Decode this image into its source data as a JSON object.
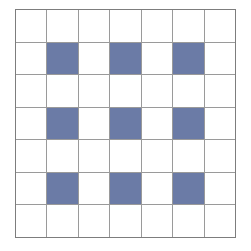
{
  "figure": {
    "name": "checkerboard-grid",
    "rows": 7,
    "columns": 7,
    "fill_color": "#6b7ba6",
    "empty_color": "#ffffff",
    "gridline_color": "#9a9a9a",
    "border_color": "#7d7d7d",
    "background_color": "#ffffff"
  },
  "chart_data": {
    "type": "heatmap",
    "title": "",
    "xlabel": "",
    "ylabel": "",
    "rows": 7,
    "columns": 7,
    "legend": [
      {
        "label": "filled",
        "value": 1,
        "color": "#6b7ba6"
      },
      {
        "label": "empty",
        "value": 0,
        "color": "#ffffff"
      }
    ],
    "grid": [
      [
        0,
        0,
        0,
        0,
        0,
        0,
        0
      ],
      [
        0,
        1,
        0,
        1,
        0,
        1,
        0
      ],
      [
        0,
        0,
        0,
        0,
        0,
        0,
        0
      ],
      [
        0,
        1,
        0,
        1,
        0,
        1,
        0
      ],
      [
        0,
        0,
        0,
        0,
        0,
        0,
        0
      ],
      [
        0,
        1,
        0,
        1,
        0,
        1,
        0
      ],
      [
        0,
        0,
        0,
        0,
        0,
        0,
        0
      ]
    ],
    "filled_cells": [
      {
        "row": 1,
        "col": 1
      },
      {
        "row": 1,
        "col": 3
      },
      {
        "row": 1,
        "col": 5
      },
      {
        "row": 3,
        "col": 1
      },
      {
        "row": 3,
        "col": 3
      },
      {
        "row": 3,
        "col": 5
      },
      {
        "row": 5,
        "col": 1
      },
      {
        "row": 5,
        "col": 3
      },
      {
        "row": 5,
        "col": 5
      }
    ],
    "filled_count": 9,
    "empty_count": 40,
    "total_cells": 49
  }
}
